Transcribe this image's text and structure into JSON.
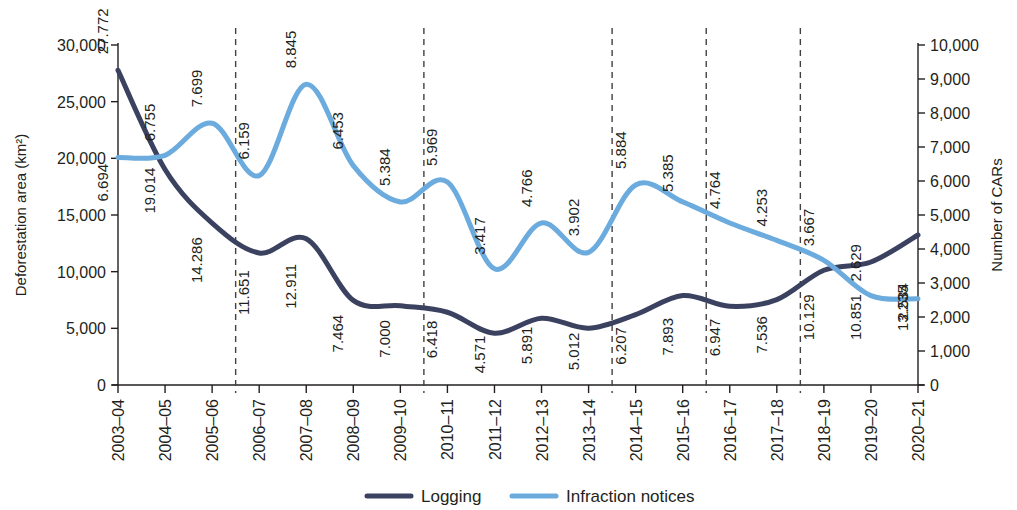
{
  "chart_data": {
    "type": "line",
    "title": "",
    "xlabel": "",
    "ylabel": "Deforestation area (km²)",
    "y2label": "Number of CARs",
    "grid": false,
    "legend_position": "bottom",
    "categories": [
      "2003–04",
      "2004–05",
      "2005–06",
      "2006–07",
      "2007–08",
      "2008–09",
      "2009–10",
      "2010–11",
      "2011–12",
      "2012–13",
      "2013–14",
      "2014–15",
      "2015–16",
      "2016–17",
      "2017–18",
      "2018–19",
      "2019–20",
      "2020–21"
    ],
    "ylim": [
      0,
      30000
    ],
    "yticks": [
      "0",
      "5,000",
      "10,000",
      "15,000",
      "20,000",
      "25,000",
      "30,000"
    ],
    "ytick_values": [
      0,
      5000,
      10000,
      15000,
      20000,
      25000,
      30000
    ],
    "y2lim": [
      0,
      10000
    ],
    "y2ticks": [
      "0",
      "1,000",
      "2,000",
      "3,000",
      "4,000",
      "5,000",
      "6,000",
      "7,000",
      "8,000",
      "9,000",
      "10,000"
    ],
    "y2tick_values": [
      0,
      1000,
      2000,
      3000,
      4000,
      5000,
      6000,
      7000,
      8000,
      9000,
      10000
    ],
    "series": [
      {
        "name": "Logging",
        "color": "#3b4260",
        "axis": "left",
        "values": [
          27772,
          19014,
          14286,
          11651,
          12911,
          7464,
          7000,
          6418,
          4571,
          5891,
          5012,
          6207,
          7893,
          6947,
          7536,
          10129,
          10851,
          13235
        ],
        "labels": [
          "27.772",
          "19.014",
          "14.286",
          "11.651",
          "12.911",
          "7.464",
          "7.000",
          "6.418",
          "4.571",
          "5.891",
          "5.012",
          "6.207",
          "7.893",
          "6.947",
          "7.536",
          "10.129",
          "10.851",
          "13.235"
        ]
      },
      {
        "name": "Infraction notices",
        "color": "#6cabdd",
        "axis": "right",
        "values": [
          6694,
          6755,
          7699,
          6159,
          8845,
          6453,
          5384,
          5969,
          3417,
          4766,
          3902,
          5884,
          5385,
          4764,
          4253,
          3667,
          2629,
          2534
        ],
        "labels": [
          "6.694",
          "6.755",
          "7.699",
          "6.159",
          "8.845",
          "6.453",
          "5.384",
          "5.969",
          "3.417",
          "4.766",
          "3.902",
          "5.884",
          "5.385",
          "4.764",
          "4.253",
          "3.667",
          "2.629",
          "2.534"
        ]
      }
    ],
    "separators_after_category": [
      "2005–06",
      "2009–10",
      "2013–14",
      "2015–16",
      "2017–18"
    ],
    "legend": [
      {
        "label": "Logging",
        "color": "#3b4260"
      },
      {
        "label": "Infraction notices",
        "color": "#6cabdd"
      }
    ]
  }
}
